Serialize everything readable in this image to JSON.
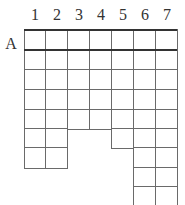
{
  "grid": {
    "column_labels": [
      "1",
      "2",
      "3",
      "4",
      "5",
      "6",
      "7"
    ],
    "row_label": "A",
    "columns": [
      {
        "label": "1",
        "rows": 7
      },
      {
        "label": "2",
        "rows": 7
      },
      {
        "label": "3",
        "rows": 5
      },
      {
        "label": "4",
        "rows": 5
      },
      {
        "label": "5",
        "rows": 6
      },
      {
        "label": "6",
        "rows": 9
      },
      {
        "label": "7",
        "rows": 9
      }
    ],
    "line_color": "#6a6a6a",
    "header_line_color": "#333333"
  }
}
